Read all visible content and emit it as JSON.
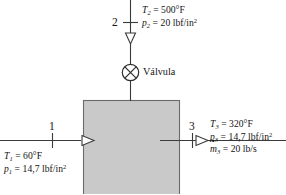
{
  "diagram": {
    "language": "es",
    "colors": {
      "box_fill": "#c9c9c9",
      "box_stroke": "#6b6b6b",
      "line": "#3a3a3a",
      "text": "#141414"
    },
    "valve": {
      "label": "Válvula",
      "symbol": "circle-with-x"
    },
    "streams": [
      {
        "id": "1",
        "number": "1",
        "direction": "right",
        "position": "left-inlet",
        "properties": [
          {
            "symbol": "T",
            "subscript": "1",
            "value": "60",
            "unit": "°F",
            "text": "T₁ = 60°F"
          },
          {
            "symbol": "p",
            "subscript": "1",
            "value": "14,7",
            "unit": "lbf/in²",
            "text": "p₁ = 14,7 lbf/in²"
          }
        ]
      },
      {
        "id": "2",
        "number": "2",
        "direction": "down",
        "position": "top-inlet",
        "properties": [
          {
            "symbol": "T",
            "subscript": "2",
            "value": "500",
            "unit": "°F",
            "text": "T₂ = 500°F"
          },
          {
            "symbol": "p",
            "subscript": "2",
            "value": "20",
            "unit": "lbf/in²",
            "text": "p₂ = 20 lbf/in²"
          }
        ]
      },
      {
        "id": "3",
        "number": "3",
        "direction": "right",
        "position": "right-outlet",
        "properties": [
          {
            "symbol": "T",
            "subscript": "3",
            "value": "320",
            "unit": "°F",
            "text": "T₃ = 320°F"
          },
          {
            "symbol": "p",
            "subscript": "3",
            "value": "14,7",
            "unit": "lbf/in²",
            "text": "p₃ = 14,7 lbf/in²"
          },
          {
            "symbol": "mdot",
            "subscript": "3",
            "value": "20",
            "unit": "lb/s",
            "text": "ṁ₃ = 20 lb/s"
          }
        ]
      }
    ],
    "labels": {
      "T2_sym": "T",
      "T2_sub": "2",
      "T2_eq": " = 500°F",
      "p2_sym": "p",
      "p2_sub": "2",
      "p2_eq": " = 20 lbf/in",
      "p2_sup": "2",
      "T1_sym": "T",
      "T1_sub": "1",
      "T1_eq": " = 60°F",
      "p1_sym": "p",
      "p1_sub": "1",
      "p1_eq": " = 14,7 lbf/in",
      "p1_sup": "2",
      "T3_sym": "T",
      "T3_sub": "3",
      "T3_eq": " = 320°F",
      "p3_sym": "p",
      "p3_sub": "3",
      "p3_eq": " = 14,7 lbf/in",
      "p3_sup": "2",
      "m3_sym": "m",
      "m3_sub": "3",
      "m3_eq": " = 20 lb/s",
      "num1": "1",
      "num2": "2",
      "num3": "3"
    }
  }
}
